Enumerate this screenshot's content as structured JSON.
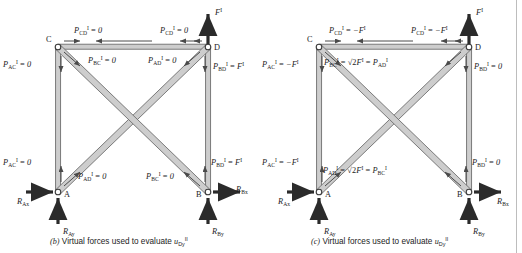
{
  "figure": {
    "divider_color": "#bdbdbd",
    "member_fill": "#c9c9c9",
    "member_stroke": "#6e6e6e",
    "arrow_color": "#4a4a4a",
    "bold_arrow_color": "#2b2b2b",
    "text_color": "#1c1c1c"
  },
  "panels": [
    {
      "id": "b",
      "caption": {
        "tag": "(b)",
        "text": "Virtual forces used to evaluate",
        "symbol": "u",
        "symbol_sub": "Dy",
        "symbol_sup": "II"
      },
      "nodes": [
        {
          "name": "C",
          "label": "C",
          "x": 58,
          "y": 47
        },
        {
          "name": "D",
          "label": "D",
          "x": 208,
          "y": 47
        },
        {
          "name": "A",
          "label": "A",
          "x": 58,
          "y": 192
        },
        {
          "name": "B",
          "label": "B",
          "x": 208,
          "y": 192
        }
      ],
      "applied_load": {
        "label": "F",
        "sup": "I",
        "at_node": "D",
        "direction": "up"
      },
      "reactions": [
        {
          "label": "R",
          "sub": "Ax",
          "at_node": "A",
          "direction": "right"
        },
        {
          "label": "R",
          "sub": "Ay",
          "at_node": "A",
          "direction": "up"
        },
        {
          "label": "R",
          "sub": "Bx",
          "at_node": "B",
          "direction": "right"
        },
        {
          "label": "R",
          "sub": "By",
          "at_node": "B",
          "direction": "up"
        }
      ],
      "member_forces": [
        {
          "name": "CD-top-left",
          "symbol": "P",
          "sub": "CD",
          "sup": "I",
          "eq": "=",
          "value": "0"
        },
        {
          "name": "CD-top-right",
          "symbol": "P",
          "sub": "CD",
          "sup": "I",
          "eq": "=",
          "value": "0"
        },
        {
          "name": "AC-top",
          "symbol": "P",
          "sub": "AC",
          "sup": "I",
          "eq": "=",
          "value": "0"
        },
        {
          "name": "BC-top",
          "symbol": "P",
          "sub": "BC",
          "sup": "I",
          "eq": "=",
          "value": "0"
        },
        {
          "name": "AD-top",
          "symbol": "P",
          "sub": "AD",
          "sup": "I",
          "eq": "=",
          "value": "0"
        },
        {
          "name": "BD-top",
          "symbol": "P",
          "sub": "BD",
          "sup": "I",
          "eq": "=",
          "value": "F",
          "value_sup": "I"
        },
        {
          "name": "AC-bottom",
          "symbol": "P",
          "sub": "AC",
          "sup": "I",
          "eq": "=",
          "value": "0"
        },
        {
          "name": "AD-bottom",
          "symbol": "P",
          "sub": "AD",
          "sup": "I",
          "eq": "=",
          "value": "0"
        },
        {
          "name": "BC-bottom",
          "symbol": "P",
          "sub": "BC",
          "sup": "I",
          "eq": "=",
          "value": "0"
        },
        {
          "name": "BD-bottom",
          "symbol": "P",
          "sub": "BD",
          "sup": "I",
          "eq": "=",
          "value": "F",
          "value_sup": "I"
        }
      ]
    },
    {
      "id": "c",
      "caption": {
        "tag": "(c)",
        "text": "Virtual forces used to evaluate",
        "symbol": "u",
        "symbol_sub": "Dy",
        "symbol_sup": "II"
      },
      "nodes": [
        {
          "name": "C",
          "label": "C",
          "x": 58,
          "y": 47
        },
        {
          "name": "D",
          "label": "D",
          "x": 208,
          "y": 47
        },
        {
          "name": "A",
          "label": "A",
          "x": 58,
          "y": 192
        },
        {
          "name": "B",
          "label": "B",
          "x": 208,
          "y": 192
        }
      ],
      "applied_load": {
        "label": "F",
        "sup": "I",
        "at_node": "D",
        "direction": "up"
      },
      "reactions": [
        {
          "label": "R",
          "sub": "Ax",
          "at_node": "A",
          "direction": "right"
        },
        {
          "label": "R",
          "sub": "Ay",
          "at_node": "A",
          "direction": "up"
        },
        {
          "label": "R",
          "sub": "Bx",
          "at_node": "B",
          "direction": "right"
        },
        {
          "label": "R",
          "sub": "By",
          "at_node": "B",
          "direction": "up"
        }
      ],
      "member_forces": [
        {
          "name": "CD-top-left",
          "symbol": "P",
          "sub": "CD",
          "sup": "I",
          "eq": "=",
          "value": "−F",
          "value_sup": "I"
        },
        {
          "name": "CD-top-right",
          "symbol": "P",
          "sub": "CD",
          "sup": "I",
          "eq": "=",
          "value": "−F",
          "value_sup": "I"
        },
        {
          "name": "AC-top",
          "symbol": "P",
          "sub": "AC",
          "sup": "I",
          "eq": "=",
          "value": "−F",
          "value_sup": "I"
        },
        {
          "name": "BD-top",
          "symbol": "P",
          "sub": "BD",
          "sup": "I",
          "eq": "=",
          "value": "0"
        },
        {
          "name": "AC-bottom",
          "symbol": "P",
          "sub": "AC",
          "sup": "I",
          "eq": "=",
          "value": "−F",
          "value_sup": "I"
        },
        {
          "name": "BD-bottom",
          "symbol": "P",
          "sub": "BD",
          "sup": "I",
          "eq": "=",
          "value": "0"
        }
      ],
      "diagonal_equations": [
        {
          "name": "diagonal-top",
          "lhs_symbol": "P",
          "lhs_sub": "BC",
          "lhs_sup": "I",
          "eq1": "=",
          "radical": "√2",
          "force": "F",
          "force_sup": "I",
          "eq2": "=",
          "rhs_symbol": "P",
          "rhs_sub": "AD",
          "rhs_sup": "I"
        },
        {
          "name": "diagonal-bottom",
          "lhs_symbol": "P",
          "lhs_sub": "AD",
          "lhs_sup": "I",
          "eq1": "=",
          "radical": "√2",
          "force": "F",
          "force_sup": "I",
          "eq2": "=",
          "rhs_symbol": "P",
          "rhs_sub": "BC",
          "rhs_sup": "I"
        }
      ]
    }
  ]
}
